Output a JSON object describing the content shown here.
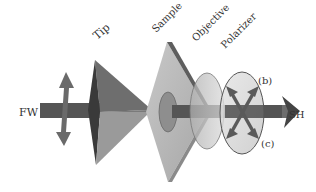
{
  "diagram": {
    "labels": {
      "tip": "Tip",
      "sample": "Sample",
      "objective": "Objective",
      "polarizer": "Polarizer",
      "input_beam": "FW",
      "output_beam": "SH",
      "polarization_b": "(b)",
      "polarization_c": "(c)"
    },
    "colors": {
      "beam": "#555555",
      "tip_dark": "#3a3a3a",
      "tip_mid": "#6e6e6e",
      "tip_light": "#9a9a9a",
      "sample_face": "#b8b8b8",
      "sample_edge": "#6a6a6a",
      "objective": "#c4c4c4",
      "polarizer": "#d8d8d8",
      "arrow": "#6a6a6a"
    }
  }
}
